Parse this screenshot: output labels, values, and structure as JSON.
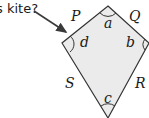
{
  "question_fragment": "s kite?",
  "colors": {
    "fill": "#ebebeb",
    "stroke": "#333333",
    "arrow": "#3a3a3a"
  },
  "shape": {
    "type": "kite",
    "vertices": {
      "top": [
        108,
        6
      ],
      "right": [
        149,
        43
      ],
      "bottom": [
        108,
        118
      ],
      "left": [
        62,
        43
      ]
    }
  },
  "side_labels": {
    "P": "P",
    "Q": "Q",
    "R": "R",
    "S": "S"
  },
  "angle_labels": {
    "a": "a",
    "b": "b",
    "c": "c",
    "d": "d"
  }
}
